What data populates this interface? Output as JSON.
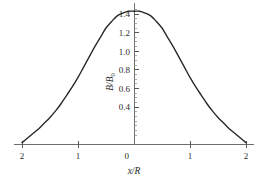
{
  "chart_data": {
    "type": "line",
    "title": "",
    "subtitle": "",
    "xlabel": "x/R",
    "ylabel": "B/B0",
    "ylabel_base": "B/B",
    "ylabel_sub": "0",
    "xlim": [
      -2.15,
      2.15
    ],
    "ylim": [
      0,
      1.52
    ],
    "grid": false,
    "legend": null,
    "x_ticks": [
      {
        "value": -2,
        "label": "2"
      },
      {
        "value": -1,
        "label": "1"
      },
      {
        "value": 0,
        "label": "0"
      },
      {
        "value": 1,
        "label": "1"
      },
      {
        "value": 2,
        "label": "2"
      }
    ],
    "y_ticks": [
      {
        "value": 0.4,
        "label": "0.4"
      },
      {
        "value": 0.6,
        "label": "0.6"
      },
      {
        "value": 0.8,
        "label": "0.8"
      },
      {
        "value": 1.0,
        "label": "1.0"
      },
      {
        "value": 1.2,
        "label": "1.2"
      },
      {
        "value": 1.4,
        "label": "1.4"
      }
    ],
    "y_minor_step": 0.05,
    "y_minor_min": 0.1,
    "y_minor_max": 1.45,
    "series": [
      {
        "name": "B/B0",
        "color": "#262626",
        "x": [
          -2.0,
          -1.9,
          -1.8,
          -1.7,
          -1.6,
          -1.5,
          -1.4,
          -1.3,
          -1.2,
          -1.1,
          -1.0,
          -0.9,
          -0.8,
          -0.7,
          -0.6,
          -0.5,
          -0.4,
          -0.3,
          -0.2,
          -0.1,
          0.0,
          0.1,
          0.2,
          0.3,
          0.4,
          0.5,
          0.6,
          0.7,
          0.8,
          0.9,
          1.0,
          1.1,
          1.2,
          1.3,
          1.4,
          1.5,
          1.6,
          1.7,
          1.8,
          1.9,
          2.0
        ],
        "y": [
          0.02,
          0.07,
          0.12,
          0.17,
          0.23,
          0.29,
          0.36,
          0.44,
          0.53,
          0.62,
          0.72,
          0.83,
          0.94,
          1.05,
          1.15,
          1.25,
          1.32,
          1.38,
          1.41,
          1.43,
          1.43,
          1.43,
          1.41,
          1.38,
          1.32,
          1.25,
          1.15,
          1.05,
          0.94,
          0.83,
          0.72,
          0.62,
          0.53,
          0.44,
          0.36,
          0.29,
          0.23,
          0.17,
          0.12,
          0.07,
          0.02
        ]
      }
    ],
    "annotations": []
  }
}
